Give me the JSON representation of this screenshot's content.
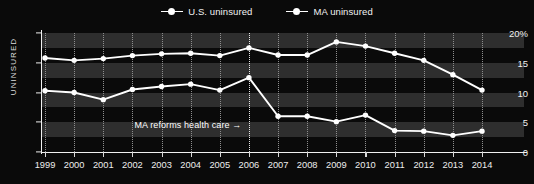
{
  "legend": {
    "position": "top-center",
    "entries": [
      {
        "label": "U.S. uninsured",
        "color": "#ffffff",
        "icon": "line-dot-marker"
      },
      {
        "label": "MA uninsured",
        "color": "#ffffff",
        "icon": "line-dot-marker"
      }
    ]
  },
  "annotation": {
    "text": "MA reforms health care →",
    "year": 2006
  },
  "chart_data": {
    "type": "line",
    "title": "",
    "xlabel": "",
    "ylabel": "UNINSURED",
    "x": [
      1999,
      2000,
      2001,
      2002,
      2003,
      2004,
      2005,
      2006,
      2007,
      2008,
      2009,
      2010,
      2011,
      2012,
      2013,
      2014
    ],
    "xtick_labels": [
      "1999",
      "2000",
      "2001",
      "2002",
      "2003",
      "2004",
      "2005",
      "2006",
      "2007",
      "2008",
      "2009",
      "2010",
      "2011",
      "2012",
      "2013",
      "2014"
    ],
    "ytick_labels": [
      "0",
      "5",
      "10",
      "15",
      "20%"
    ],
    "ytick_values": [
      0,
      5,
      10,
      15,
      20
    ],
    "ylim": [
      0,
      20
    ],
    "xlim": [
      1999,
      2014
    ],
    "grid": "vertical-dotted-banded-horizontal",
    "series": [
      {
        "name": "U.S. uninsured",
        "color": "#ffffff",
        "values": [
          15.8,
          15.4,
          15.7,
          16.2,
          16.5,
          16.6,
          16.2,
          17.5,
          16.3,
          16.3,
          18.5,
          17.8,
          16.6,
          15.4,
          13.0,
          10.4
        ]
      },
      {
        "name": "MA uninsured",
        "color": "#ffffff",
        "values": [
          10.3,
          10.0,
          8.8,
          10.5,
          11.0,
          11.4,
          10.4,
          12.5,
          6.0,
          6.0,
          5.1,
          6.2,
          3.6,
          3.5,
          2.8,
          3.5
        ]
      }
    ]
  },
  "style": {
    "background": "#0a0a0a",
    "band_color": "#2e2e2e",
    "axis_color": "#f0f0f0",
    "grid_color": "#8e8e8e",
    "event_line_color": "#f4f4f4"
  }
}
